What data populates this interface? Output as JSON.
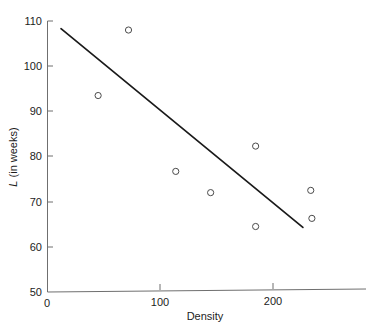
{
  "chart_data": {
    "type": "scatter",
    "title": "",
    "xlabel": "Density",
    "ylabel": "L (in weeks)",
    "ylabel_italic_part": "L",
    "ylabel_rest_part": " (in weeks)",
    "xlim": [
      0,
      280
    ],
    "ylim": [
      50,
      110
    ],
    "xticks": [
      0,
      100,
      200
    ],
    "xtick_labels": [
      "0",
      "100",
      "200"
    ],
    "yticks": [
      50,
      60,
      70,
      80,
      90,
      100,
      110
    ],
    "ytick_labels": [
      "50",
      "60",
      "70",
      "80",
      "90",
      "100",
      "110"
    ],
    "grid": false,
    "legend": "none",
    "marker": "open-circle",
    "points": [
      {
        "x": 45,
        "y": 93.5
      },
      {
        "x": 72,
        "y": 108.0
      },
      {
        "x": 114,
        "y": 76.7
      },
      {
        "x": 145,
        "y": 72.0
      },
      {
        "x": 185,
        "y": 82.3
      },
      {
        "x": 185,
        "y": 64.5
      },
      {
        "x": 234,
        "y": 72.5
      },
      {
        "x": 235,
        "y": 66.3
      }
    ],
    "series": [
      {
        "name": "observations",
        "x": [
          45,
          72,
          114,
          145,
          185,
          185,
          234,
          235
        ],
        "values": [
          93.5,
          108.0,
          76.7,
          72.0,
          82.3,
          64.5,
          72.5,
          66.3
        ]
      },
      {
        "name": "regression-line",
        "type": "line",
        "x": [
          12,
          227
        ],
        "values": [
          108.3,
          64.3
        ]
      }
    ],
    "fit_line": {
      "x_start": 12,
      "y_start": 108.3,
      "x_end": 227,
      "y_end": 64.3
    }
  }
}
